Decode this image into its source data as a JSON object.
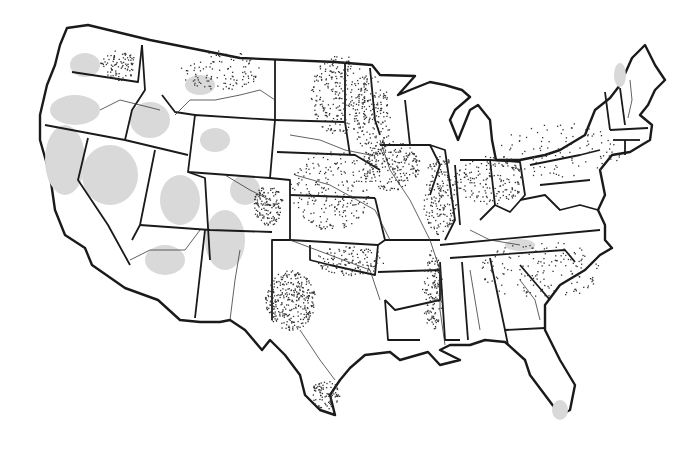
{
  "map": {
    "type": "dot-distribution",
    "region": "Contiguous United States",
    "colors": {
      "background": "#ffffff",
      "land": "#ffffff",
      "boundary": "#1a1a1a",
      "shaded_area": "#d9d9d9",
      "dot": "#333333",
      "river": "#3a3a3a"
    },
    "dense_dot_regions": [
      {
        "name": "North Dakota / Red River valley",
        "cx": 340,
        "cy": 95,
        "rx": 30,
        "ry": 40,
        "n": 260
      },
      {
        "name": "Minnesota west",
        "cx": 372,
        "cy": 120,
        "rx": 18,
        "ry": 45,
        "n": 180
      },
      {
        "name": "Iowa",
        "cx": 390,
        "cy": 165,
        "rx": 30,
        "ry": 25,
        "n": 220
      },
      {
        "name": "Illinois",
        "cx": 440,
        "cy": 195,
        "rx": 18,
        "ry": 40,
        "n": 200
      },
      {
        "name": "Indiana / Ohio",
        "cx": 490,
        "cy": 180,
        "rx": 35,
        "ry": 25,
        "n": 170
      },
      {
        "name": "Texas panhandle / West Texas",
        "cx": 290,
        "cy": 300,
        "rx": 25,
        "ry": 30,
        "n": 320
      },
      {
        "name": "Eastern Colorado",
        "cx": 268,
        "cy": 205,
        "rx": 15,
        "ry": 20,
        "n": 140
      },
      {
        "name": "Kansas / Nebraska",
        "cx": 330,
        "cy": 190,
        "rx": 40,
        "ry": 40,
        "n": 230
      },
      {
        "name": "Eastern Washington",
        "cx": 118,
        "cy": 65,
        "rx": 18,
        "ry": 15,
        "n": 90
      },
      {
        "name": "Montana plains",
        "cx": 220,
        "cy": 70,
        "rx": 40,
        "ry": 20,
        "n": 110
      },
      {
        "name": "South Texas coast",
        "cx": 325,
        "cy": 395,
        "rx": 15,
        "ry": 15,
        "n": 90
      },
      {
        "name": "Mississippi delta",
        "cx": 432,
        "cy": 290,
        "rx": 10,
        "ry": 40,
        "n": 140
      },
      {
        "name": "Oklahoma",
        "cx": 350,
        "cy": 260,
        "rx": 35,
        "ry": 15,
        "n": 130
      },
      {
        "name": "Southeast",
        "cx": 540,
        "cy": 270,
        "rx": 60,
        "ry": 30,
        "n": 160
      },
      {
        "name": "Great Lakes / Northeast",
        "cx": 560,
        "cy": 150,
        "rx": 60,
        "ry": 30,
        "n": 110
      }
    ]
  }
}
